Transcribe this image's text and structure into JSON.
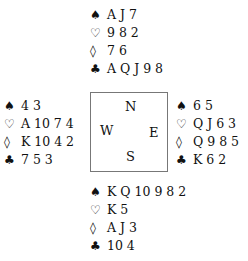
{
  "suits": {
    "spades": "♠",
    "hearts": "♡",
    "diamonds": "◊",
    "clubs": "♣"
  },
  "hands": {
    "north": {
      "spades": "A J 7",
      "hearts": "9 8 2",
      "diamonds": "7 6",
      "clubs": "A Q J 9 8"
    },
    "west": {
      "spades": "4 3",
      "hearts": "A 10 7 4",
      "diamonds": "K 10 4 2",
      "clubs": "7 5 3"
    },
    "east": {
      "spades": "6 5",
      "hearts": "Q J 6 3",
      "diamonds": "Q 9 8 5",
      "clubs": "K 6 2"
    },
    "south": {
      "spades": "K Q 10 9 8 2",
      "hearts": "K 5",
      "diamonds": "A J 3",
      "clubs": "10 4"
    }
  },
  "compass": {
    "n": "N",
    "w": "W",
    "e": "E",
    "s": "S"
  }
}
